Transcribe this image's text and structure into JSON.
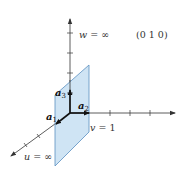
{
  "diagram": {
    "miller_indices": "(0 1 0)",
    "axes": {
      "u": {
        "name": "u",
        "intercept_label": "u = ∞",
        "var": "u",
        "value": "∞"
      },
      "v": {
        "name": "v",
        "intercept_label": "v = 1",
        "var": "v",
        "value": "1"
      },
      "w": {
        "name": "w",
        "intercept_label": "w = ∞",
        "var": "w",
        "value": "∞"
      }
    },
    "vectors": [
      {
        "name": "a1",
        "base": "a",
        "sub": "1"
      },
      {
        "name": "a2",
        "base": "a",
        "sub": "2"
      },
      {
        "name": "a3",
        "base": "a",
        "sub": "3"
      }
    ],
    "plane": {
      "fill": "#cfe4f4",
      "stroke": "#5a8fc0"
    },
    "colors": {
      "axis": "#333333",
      "vector": "#111111"
    },
    "eq": " = "
  }
}
